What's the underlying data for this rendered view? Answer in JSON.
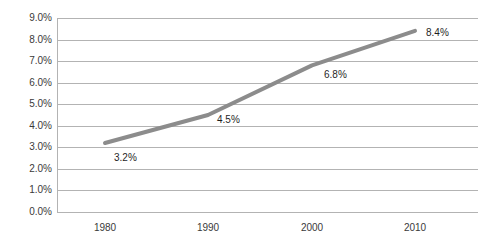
{
  "chart_data": {
    "type": "line",
    "title": "",
    "subtitle": "",
    "xlabel": "",
    "ylabel": "",
    "categories": [
      "1980",
      "1990",
      "2000",
      "2010"
    ],
    "x": [
      1980,
      1990,
      2000,
      2010
    ],
    "values": [
      3.2,
      4.5,
      6.8,
      8.4
    ],
    "point_labels": [
      "3.2%",
      "4.5%",
      "6.8%",
      "8.4%"
    ],
    "series": [
      {
        "name": "",
        "values": [
          3.2,
          4.5,
          6.8,
          8.4
        ]
      }
    ],
    "ylim": [
      0.0,
      9.0
    ],
    "ytick_step": 1.0,
    "ytick_labels": [
      "9.0%",
      "8.0%",
      "7.0%",
      "6.0%",
      "5.0%",
      "4.0%",
      "3.0%",
      "2.0%",
      "1.0%",
      "0.0%"
    ],
    "ytick_values": [
      9.0,
      8.0,
      7.0,
      6.0,
      5.0,
      4.0,
      3.0,
      2.0,
      1.0,
      0.0
    ],
    "xtick_labels": [
      "1980",
      "1990",
      "2000",
      "2010"
    ],
    "grid": "horizontal",
    "legend": "none",
    "line_color": "#8c8c8c",
    "grid_color": "#b3b3b3",
    "text_color": "#3a3a3a",
    "background": "#ffffff",
    "line_width": 4,
    "markers": "none",
    "annotations": [
      {
        "label": "3.2%",
        "x": 1980,
        "y": 3.2,
        "position": "below-right"
      },
      {
        "label": "4.5%",
        "x": 1990,
        "y": 4.5,
        "position": "right"
      },
      {
        "label": "6.8%",
        "x": 2000,
        "y": 6.8,
        "position": "below-right"
      },
      {
        "label": "8.4%",
        "x": 2010,
        "y": 8.4,
        "position": "right"
      }
    ]
  }
}
